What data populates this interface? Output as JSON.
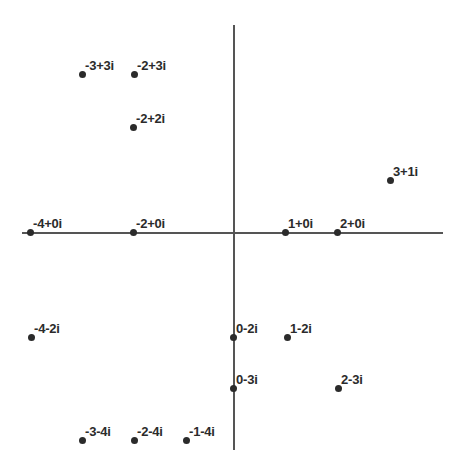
{
  "chart_data": {
    "type": "scatter",
    "title": "",
    "subtitle": "",
    "xlabel": "",
    "ylabel": "",
    "xlim": [
      -4.2,
      4.1
    ],
    "ylim": [
      -4.1,
      4.1
    ],
    "grid": false,
    "legend": null,
    "axes": {
      "real_axis": true,
      "imaginary_axis": true,
      "origin_px": [
        233,
        232
      ],
      "unit_px": 51.5,
      "real_axis_extent_px": [
        22,
        443
      ],
      "imag_axis_extent_px": [
        25,
        450
      ],
      "axis_color": "#555555"
    },
    "point_color": "#2b2b2b",
    "labels_are_point_values": true,
    "points": [
      {
        "label": "-3+3i",
        "re": -3,
        "im": 3,
        "x_px": 82,
        "y_px": 74
      },
      {
        "label": "-2+3i",
        "re": -2,
        "im": 3,
        "x_px": 134,
        "y_px": 74
      },
      {
        "label": "-2+2i",
        "re": -2,
        "im": 2,
        "x_px": 133,
        "y_px": 127
      },
      {
        "label": "3+1i",
        "re": 3,
        "im": 1,
        "x_px": 390,
        "y_px": 180
      },
      {
        "label": "-4+0i",
        "re": -4,
        "im": 0,
        "x_px": 30,
        "y_px": 232
      },
      {
        "label": "-2+0i",
        "re": -2,
        "im": 0,
        "x_px": 133,
        "y_px": 232
      },
      {
        "label": "1+0i",
        "re": 1,
        "im": 0,
        "x_px": 285,
        "y_px": 232
      },
      {
        "label": "2+0i",
        "re": 2,
        "im": 0,
        "x_px": 337,
        "y_px": 232
      },
      {
        "label": "-4-2i",
        "re": -4,
        "im": -2,
        "x_px": 31,
        "y_px": 337
      },
      {
        "label": "0-2i",
        "re": 0,
        "im": -2,
        "x_px": 233,
        "y_px": 337
      },
      {
        "label": "1-2i",
        "re": 1,
        "im": -2,
        "x_px": 287,
        "y_px": 337
      },
      {
        "label": "0-3i",
        "re": 0,
        "im": -3,
        "x_px": 233,
        "y_px": 388
      },
      {
        "label": "2-3i",
        "re": 2,
        "im": -3,
        "x_px": 338,
        "y_px": 388
      },
      {
        "label": "-3-4i",
        "re": -3,
        "im": -4,
        "x_px": 82,
        "y_px": 440
      },
      {
        "label": "-2-4i",
        "re": -2,
        "im": -4,
        "x_px": 134,
        "y_px": 440
      },
      {
        "label": "-1-4i",
        "re": -1,
        "im": -4,
        "x_px": 186,
        "y_px": 440
      }
    ]
  }
}
